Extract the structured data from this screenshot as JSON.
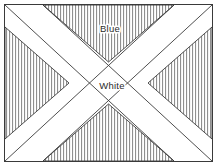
{
  "figure": {
    "border_color": "#3a3a3a",
    "background_color": "#ffffff"
  },
  "flag": {
    "field": {
      "name": "Blue",
      "label": "Blue",
      "hatch_style": "vertical-lines",
      "hatch_color": "#6e6e6e",
      "hatch_spacing_px": 3,
      "label_x": 110,
      "label_y": 29
    },
    "cross": {
      "name": "White",
      "label": "White",
      "shape": "saltire",
      "fill_color": "#ffffff",
      "outline_color": "#3a3a3a",
      "label_x": 112,
      "label_y": 86
    }
  },
  "geometry": {
    "border": {
      "x": 4.5,
      "y": 4.5,
      "width": 208,
      "height": 157
    },
    "band_half_width": 18,
    "center": {
      "x": 108.5,
      "y": 83
    }
  },
  "labels": [
    {
      "id": "field-label",
      "text": "Blue"
    },
    {
      "id": "cross-label",
      "text": "White"
    }
  ]
}
